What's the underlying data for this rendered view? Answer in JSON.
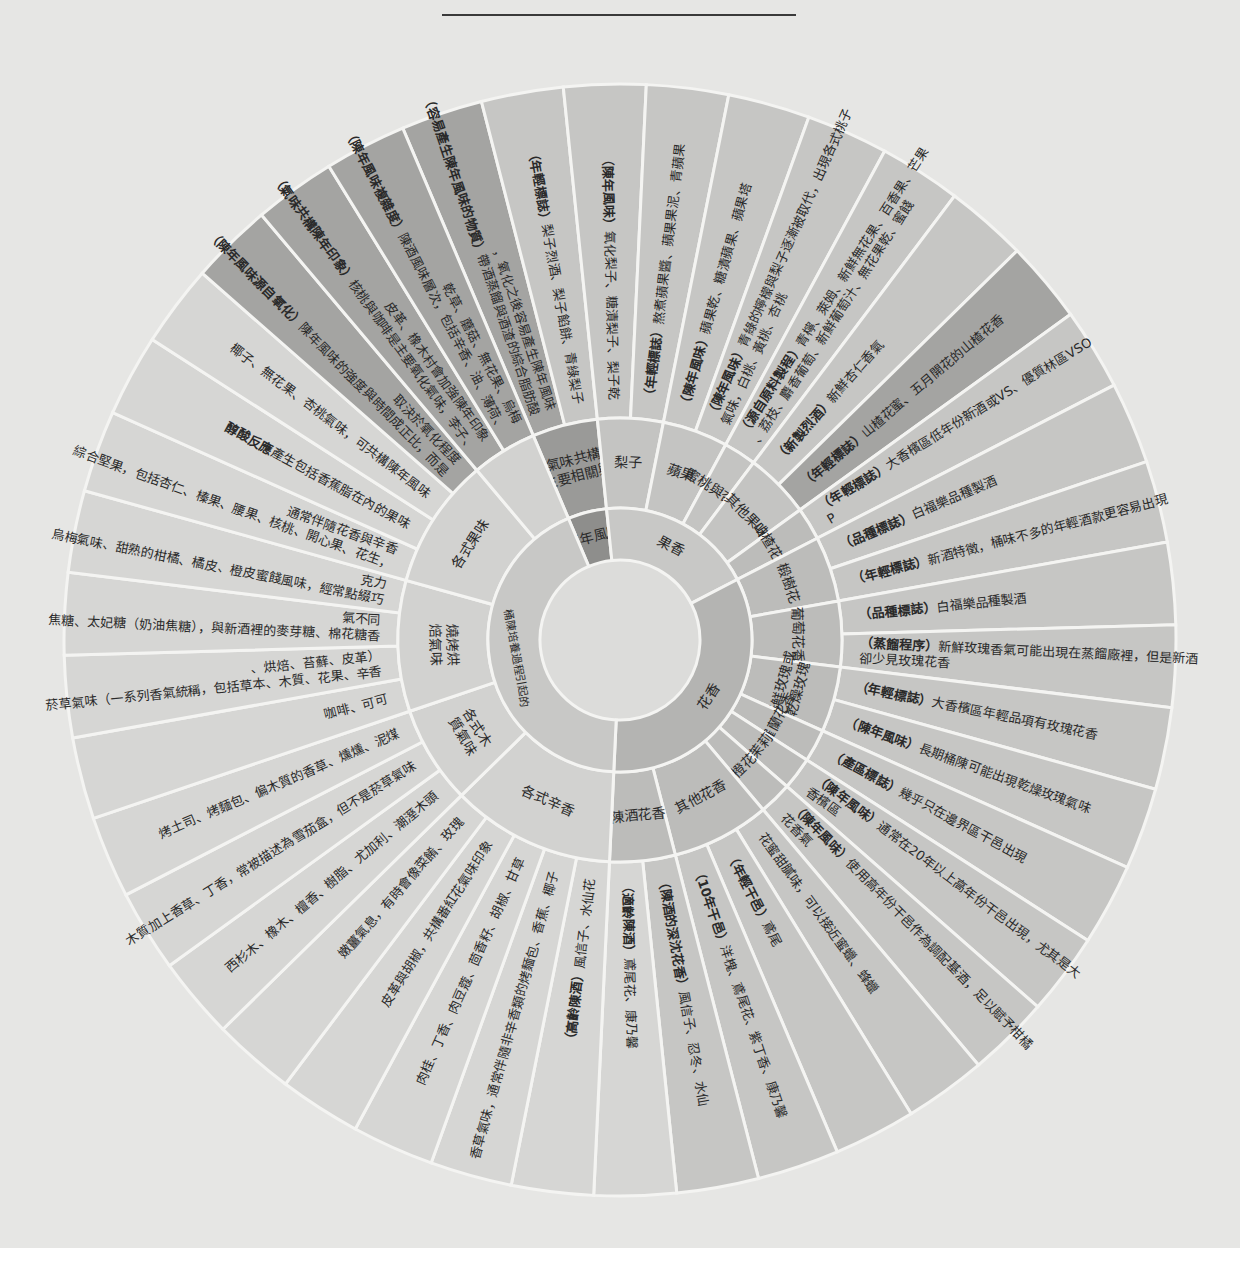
{
  "center": {
    "x": 620,
    "y": 640
  },
  "radii": {
    "hole": 80,
    "inner": 132,
    "middle": 222,
    "outer": 556
  },
  "start_angle": -113,
  "colors": {
    "page": "#e6e6e4",
    "separator": "#f4f4f2",
    "hole": "#dcdcda",
    "fruit_inner": "#c8c8c6",
    "floral_inner": "#b4b4b2",
    "cask_inner": "#c8c8c6",
    "aged_inner": "#8e8e8c",
    "fruit_mid": "#c4c4c2",
    "floral_mid": "#bcbcba",
    "cask_mid": "#d2d2d0",
    "aged_mid": "#9a9a98",
    "outer_light": "#d6d6d4",
    "outer_mid": "#c6c6c4",
    "outer_dark": "#a4a4a2"
  },
  "inner_ring": [
    {
      "label": "陳年風味",
      "span": 2,
      "tone": "aged_inner"
    },
    {
      "label": "果香",
      "span": 8,
      "tone": "fruit_inner"
    },
    {
      "label": "花香",
      "span": 14,
      "tone": "floral_inner"
    },
    {
      "label": "桶陳培養過程引起的",
      "span": 18,
      "tone": "cask_inner"
    }
  ],
  "middle_ring": [
    {
      "label": "主要相關與氣味共構",
      "span": 2,
      "tone": "aged_mid"
    },
    {
      "label": "梨子",
      "span": 2,
      "tone": "fruit_mid"
    },
    {
      "label": "蘋果",
      "span": 2,
      "tone": "fruit_mid"
    },
    {
      "label": "蜜桃與杏桃",
      "span": 1,
      "tone": "fruit_mid"
    },
    {
      "label": "其他果味",
      "span": 2,
      "tone": "fruit_mid"
    },
    {
      "label": "山楂花蜜",
      "span": 1,
      "tone": "floral_mid"
    },
    {
      "label": "椴樹花",
      "span": 2,
      "tone": "floral_mid"
    },
    {
      "label": "葡萄花香",
      "span": 2,
      "tone": "floral_mid"
    },
    {
      "label": "新鮮玫瑰或乾燥玫瑰",
      "span": 2,
      "tone": "floral_mid"
    },
    {
      "label": "紫羅蘭花香",
      "span": 1,
      "tone": "floral_mid"
    },
    {
      "label": "茉莉",
      "span": 1,
      "tone": "floral_mid"
    },
    {
      "label": "橙花",
      "span": 1,
      "tone": "floral_mid"
    },
    {
      "label": "其他花香",
      "span": 3,
      "tone": "floral_mid"
    },
    {
      "label": "陳酒花香",
      "span": 2,
      "tone": "floral_mid"
    },
    {
      "label": "各式辛香",
      "span": 5,
      "tone": "cask_mid"
    },
    {
      "label": "各式木質氣味",
      "span": 3,
      "tone": "cask_mid"
    },
    {
      "label": "燒烤烘焙氣味",
      "span": 4,
      "tone": "cask_mid"
    },
    {
      "label": "各式果味",
      "span": 4,
      "tone": "cask_mid"
    },
    {
      "label": "",
      "span": 2,
      "tone": "cask_mid"
    }
  ],
  "outer_ring": [
    {
      "tag": "（容易產生陳年風味的物質）",
      "text": "帶酒蒸餾與酒渣的綜合脂肪酸，氧化之後容易產生陳年風味",
      "tone": "outer_dark"
    },
    {
      "tag": "（年輕標誌）",
      "text": "梨子烈酒、梨子餡餅、青綠梨子",
      "tone": "outer_mid"
    },
    {
      "tag": "（陳年風味）",
      "text": "氧化梨子、糖漬梨子、梨子乾",
      "tone": "outer_mid"
    },
    {
      "tag": "（年輕標誌）",
      "text": "熬煮蘋果醬、蘋果果泥、青蘋果",
      "tone": "outer_mid"
    },
    {
      "tag": "（陳年風味）",
      "text": "蘋果乾、糖漬蘋果、蘋果塔",
      "tone": "outer_mid"
    },
    {
      "tag": "（陳年風味）",
      "text": "青綠的檸檬與梨子逐漸被取代，出現各式桃子氣味，白桃、黃桃、杏桃",
      "tone": "outer_mid"
    },
    {
      "tag": "（源自原料製程）",
      "text": "青檸、萊姆、新鮮無花果、百香果、芒果、荔枝、麝香葡萄、新鮮葡萄汁、無花果乾、蜜餞",
      "tone": "outer_mid"
    },
    {
      "tag": "（新製烈酒）",
      "text": "新鮮杏仁香氣",
      "tone": "outer_mid"
    },
    {
      "tag": "（年輕標誌）",
      "text": "山楂花蜜、五月開花的山楂花香",
      "tone": "outer_dark"
    },
    {
      "tag": "（年輕標誌）",
      "text": "大香檳區低年份新酒或VS、優質林區VSOP",
      "tone": "outer_mid"
    },
    {
      "tag": "（品種標誌）",
      "text": "白福樂品種製酒",
      "tone": "outer_mid"
    },
    {
      "tag": "（年輕標誌）",
      "text": "新酒特徵，桶味不多的年輕酒款更容易出現",
      "tone": "outer_mid"
    },
    {
      "tag": "（品種標誌）",
      "text": "白福樂品種製酒",
      "tone": "outer_mid"
    },
    {
      "tag": "（蒸餾程序）",
      "text": "新鮮玫瑰香氣可能出現在蒸餾廠裡，但是新酒卻少見玫瑰花香",
      "tone": "outer_mid"
    },
    {
      "tag": "（年輕標誌）",
      "text": "大香檳區年輕品項有玫瑰花香",
      "tone": "outer_mid"
    },
    {
      "tag": "（陳年風味）",
      "text": "長期桶陳可能出現乾燥玫瑰氣味",
      "tone": "outer_mid"
    },
    {
      "tag": "（產區標誌）",
      "text": "幾乎只在邊界區干邑出現",
      "tone": "outer_mid"
    },
    {
      "tag": "（陳年風味）",
      "text": "通常在20年以上高年份干邑出現，尤其是大香檳區",
      "tone": "outer_mid"
    },
    {
      "tag": "（陳年風味）",
      "text": "使用高年份干邑作為調配基酒，足以賦予柑橘花香氣",
      "tone": "outer_mid"
    },
    {
      "tag": "",
      "text": "花蜜甜膩味，可以接近蜜蠟、蜂蠟",
      "tone": "outer_mid"
    },
    {
      "tag": "（年輕干邑）",
      "text": "鳶尾",
      "tone": "outer_mid"
    },
    {
      "tag": "（10年干邑）",
      "text": "洋槐、鳶尾花、紫丁香、康乃馨",
      "tone": "outer_mid"
    },
    {
      "tag": "（陳酒的深沈花香）",
      "text": "風信子、忍冬、水仙",
      "tone": "outer_mid"
    },
    {
      "tag": "（適齡陳酒）",
      "text": "鳶尾花、康乃馨",
      "tone": "outer_light"
    },
    {
      "tag": "（高齡陳酒）",
      "text": "風信子、水仙花",
      "tone": "outer_light"
    },
    {
      "tag": "",
      "text": "香草氣味，通常伴隨非辛香類的烤麵包、香蕉、椰子",
      "tone": "outer_light"
    },
    {
      "tag": "",
      "text": "肉桂、丁香、肉豆蔻、茴香籽、胡椒、甘草",
      "tone": "outer_light"
    },
    {
      "tag": "",
      "text": "皮革與胡椒，共構番紅花氣味印象",
      "tone": "outer_light"
    },
    {
      "tag": "",
      "text": "嫩薑氣息，有時會像菜餚、玫瑰",
      "tone": "outer_light"
    },
    {
      "tag": "",
      "text": "西杉木、橡木、檀香、樹脂、尤加利、潮溼木頭",
      "tone": "outer_light"
    },
    {
      "tag": "",
      "text": "木質加上香草、丁香，常被描述為雪茄盒，但不是菸草氣味",
      "tone": "outer_light"
    },
    {
      "tag": "",
      "text": "烤土司、烤麵包、偏木質的香草、燻燻、泥煤",
      "tone": "outer_light"
    },
    {
      "tag": "",
      "text": "咖啡、可可",
      "tone": "outer_light"
    },
    {
      "tag": "",
      "text": "菸草氣味（一系列香氣統稱，包括草本、木質、花果、辛香、烘焙、苔蘚、皮革）",
      "tone": "outer_light"
    },
    {
      "tag": "",
      "text": "焦糖、太妃糖（奶油焦糖），與新酒裡的麥芽糖、棉花糖香氣不同",
      "tone": "outer_light"
    },
    {
      "tag": "",
      "text": "烏梅氣味、甜熟的柑橘、橘皮、橙皮蜜餞風味，經常點綴巧克力",
      "tone": "outer_light"
    },
    {
      "tag": "",
      "text": "綜合堅果，包括杏仁、榛果、腰果、核桃、開心果、花生，通常伴隨花香與辛香",
      "tone": "outer_light"
    },
    {
      "tag": "醇酸反應",
      "text": "產生包括香蕉脂在內的果味",
      "tone": "outer_light"
    },
    {
      "tag": "",
      "text": "椰子、無花果、杏桃氣味，可共構陳年風味",
      "tone": "outer_light"
    },
    {
      "tag": "（陳年風味源自氧化）",
      "text": "陳年風味的強度與時間成正比，而是取決於氧化程度",
      "tone": "outer_dark"
    },
    {
      "tag": "（氣味共構陳年印象）",
      "text": "核桃與咖啡是主要氧化氣味，李子、皮革、橡木村會加強陳年印象",
      "tone": "outer_dark"
    },
    {
      "tag": "（陳年風味複雜度）",
      "text": "陳酒風味層次，包括辛香、油、薄荷、乾草、蘑菇、無花果、烏梅",
      "tone": "outer_dark"
    }
  ]
}
